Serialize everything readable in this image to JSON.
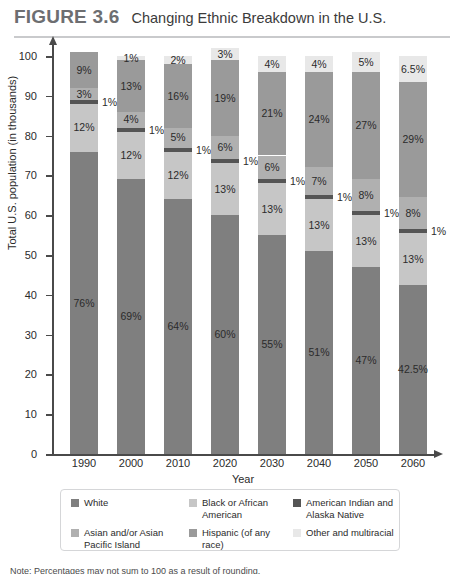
{
  "header": {
    "figure_number": "FIGURE 3.6",
    "title": "Changing Ethnic Breakdown in the U.S."
  },
  "note": "Note: Percentages may not sum to 100 as a result of rounding.",
  "legend": {
    "items": [
      {
        "label": "White",
        "color": "#7f7f7f",
        "key": "white"
      },
      {
        "label": "Black or African American",
        "color": "#c6c6c6",
        "key": "black"
      },
      {
        "label": "American Indian and Alaska Native",
        "color": "#555555",
        "key": "american-indian"
      },
      {
        "label": "Asian and/or Asian Pacific Island",
        "color": "#b0b0b0",
        "key": "asian"
      },
      {
        "label": "Hispanic (of any race)",
        "color": "#9a9a9a",
        "key": "hispanic"
      },
      {
        "label": "Other and multiracial",
        "color": "#e8e8e8",
        "key": "other"
      }
    ]
  },
  "chart_data": {
    "type": "bar",
    "subtype": "stacked-percentage",
    "title": "Changing Ethnic Breakdown in the U.S.",
    "xlabel": "Year",
    "ylabel": "Total U.S. population (in thousands)",
    "ylim": [
      0,
      100
    ],
    "yticks": [
      0,
      10,
      20,
      30,
      40,
      50,
      60,
      70,
      80,
      90,
      100
    ],
    "grid": false,
    "legend_position": "bottom",
    "categories": [
      "1990",
      "2000",
      "2010",
      "2020",
      "2030",
      "2040",
      "2050",
      "2060"
    ],
    "series": [
      {
        "name": "White",
        "color": "#7f7f7f",
        "values": [
          76,
          69,
          64,
          60,
          55,
          51,
          47,
          42.5
        ],
        "labels": [
          "76%",
          "69%",
          "64%",
          "60%",
          "55%",
          "51%",
          "47%",
          "42.5%"
        ]
      },
      {
        "name": "Black or African American",
        "color": "#c6c6c6",
        "values": [
          12,
          12,
          12,
          13,
          13,
          13,
          13,
          13
        ],
        "labels": [
          "12%",
          "12%",
          "12%",
          "13%",
          "13%",
          "13%",
          "13%",
          "13%"
        ]
      },
      {
        "name": "American Indian and Alaska Native",
        "color": "#555555",
        "values": [
          1,
          1,
          1,
          1,
          1,
          1,
          1,
          1
        ],
        "labels": [
          "1%",
          "1%",
          "1%",
          "1%",
          "1%",
          "1%",
          "1%",
          "1%"
        ],
        "labels_outside": true
      },
      {
        "name": "Asian and/or Asian Pacific Island",
        "color": "#b0b0b0",
        "values": [
          3,
          4,
          5,
          6,
          6,
          7,
          8,
          8
        ],
        "labels": [
          "3%",
          "4%",
          "5%",
          "6%",
          "6%",
          "7%",
          "8%",
          "8%"
        ]
      },
      {
        "name": "Hispanic (of any race)",
        "color": "#9a9a9a",
        "values": [
          9,
          13,
          16,
          19,
          21,
          24,
          27,
          29
        ],
        "labels": [
          "9%",
          "13%",
          "16%",
          "19%",
          "21%",
          "24%",
          "27%",
          "29%"
        ]
      },
      {
        "name": "Other and multiracial",
        "color": "#e8e8e8",
        "values": [
          0,
          1,
          2,
          3,
          4,
          4,
          5,
          6.5
        ],
        "labels": [
          "",
          "1%",
          "2%",
          "3%",
          "4%",
          "4%",
          "5%",
          "6.5%"
        ]
      }
    ]
  }
}
